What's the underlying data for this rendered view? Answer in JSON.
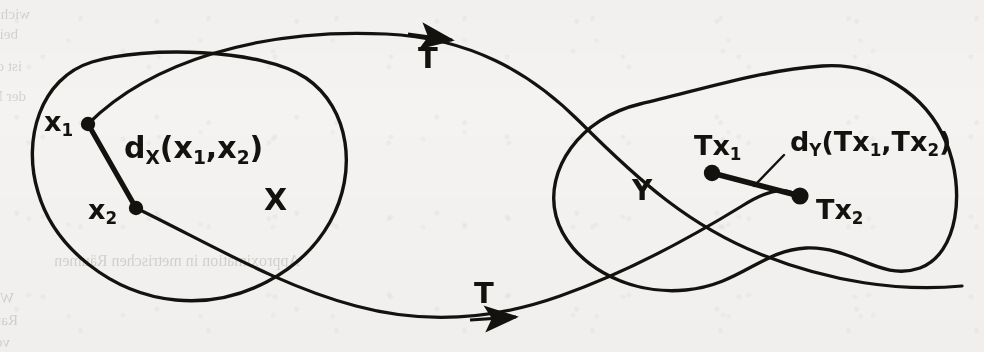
{
  "figure": {
    "type": "mathematical-diagram",
    "background_color": "#f4f3f1",
    "ink_color": "#14120f"
  },
  "sets": {
    "domain": {
      "name": "X",
      "label": "X"
    },
    "codomain": {
      "name": "Y",
      "label": "Y"
    }
  },
  "points": {
    "x1": {
      "label_main": "x",
      "label_sub": "1"
    },
    "x2": {
      "label_main": "x",
      "label_sub": "2"
    },
    "tx1": {
      "label_main": "Tx",
      "label_sub": "1"
    },
    "tx2": {
      "label_main": "Tx",
      "label_sub": "2"
    }
  },
  "distances": {
    "domain_distance": {
      "d": "d",
      "space_sub": "X",
      "open": "(",
      "arg1_main": "x",
      "arg1_sub": "1",
      "comma": ",",
      "arg2_main": "x",
      "arg2_sub": "2",
      "close": ")"
    },
    "codomain_distance": {
      "d": "d",
      "space_sub": "Y",
      "open": "(",
      "arg1_main": "Tx",
      "arg1_sub": "1",
      "comma": ",",
      "arg2_main": "Tx",
      "arg2_sub": "2",
      "close": ")"
    }
  },
  "maps": {
    "upper_arrow_label": "T",
    "lower_arrow_label": "T"
  },
  "bleed_through_text": {
    "note": "faint mirrored German text showing through from the reverse side of the page",
    "lines": [
      {
        "text": "wichtig, daß die Konvexität der Menge wichtig ist",
        "x": 30,
        "y": 6,
        "size": 15
      },
      {
        "text": "bei Approximationsproblemen von Bedeutung ist. Aber für die",
        "x": 18,
        "y": 26,
        "size": 15
      },
      {
        "text": "ist die angegebene Linie, die außere Länge des tatsächlichen",
        "x": 22,
        "y": 58,
        "size": 15
      },
      {
        "text": "der Minimumpunkte, und zwar besitzen sie das Argument, daß das Maß",
        "x": 26,
        "y": 88,
        "size": 15
      },
      {
        "text": "Approximation in metrischen Räumen",
        "x": 300,
        "y": 252,
        "size": 16
      },
      {
        "text": "Wir gehen nun aus, daß sich eine Menge G, und es sich ein Element eines Raum",
        "x": 14,
        "y": 290,
        "size": 15
      },
      {
        "text": "Raum X umgekehrt, in Figur 1. Punkt x Z geschlossen. Zu beliebigen Punkt x",
        "x": 18,
        "y": 312,
        "size": 15
      },
      {
        "text": "von y so, so umgekehrte Abbildung hat. Das ergänzte solchen Punkt übertragen wird auf eine",
        "x": 10,
        "y": 334,
        "size": 15
      }
    ]
  }
}
